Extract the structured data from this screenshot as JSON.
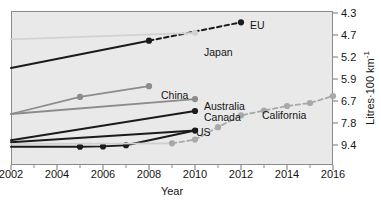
{
  "chart_data": {
    "type": "line",
    "title": "",
    "xlabel": "Year",
    "ylabel": "Litres·100 km⁻¹",
    "ylabel_base": "Litres·100 km",
    "ylabel_sup": "-1",
    "xlim": [
      2002,
      2016
    ],
    "ylim_display_top": 4.3,
    "ylim_display_bottom": 9.4,
    "y_axis_inverted": true,
    "y_axis_side": "right",
    "grid": false,
    "legend": "inline-end-labels",
    "xticks": [
      2002,
      2004,
      2006,
      2008,
      2010,
      2012,
      2014,
      2016
    ],
    "xtick_labels": [
      "2002",
      "2004",
      "2006",
      "2008",
      "2010",
      "2012",
      "2014",
      "2016"
    ],
    "xminor_ticks": [
      2003,
      2005,
      2007,
      2009,
      2011,
      2013,
      2015
    ],
    "yticks": [
      4.3,
      4.7,
      5.2,
      5.9,
      6.7,
      7.8,
      9.4
    ],
    "ytick_labels": [
      "4.3",
      "4.7",
      "5.2",
      "5.9",
      "6.7",
      "7.8",
      "9.4"
    ],
    "ytick_pixel_y": [
      13,
      35,
      57,
      79,
      101,
      123,
      145
    ],
    "series": [
      {
        "name": "EU",
        "label": "EU",
        "color": "#1b1b1b",
        "width": 2.0,
        "marker": "circle",
        "label_x": 250,
        "label_y": 26,
        "segments": [
          {
            "style": "solid",
            "points": [
              [
                2002,
                5.55
              ],
              [
                2008,
                4.83
              ]
            ]
          },
          {
            "style": "dashed",
            "points": [
              [
                2008,
                4.83
              ],
              [
                2012,
                4.47
              ]
            ]
          }
        ],
        "markers": [
          [
            2008,
            4.83
          ],
          [
            2012,
            4.47
          ]
        ]
      },
      {
        "name": "Japan",
        "label": "Japan",
        "color": "#d2d2d2",
        "width": 1.8,
        "marker": "circle",
        "label_x": 204,
        "label_y": 53,
        "segments": [
          {
            "style": "solid",
            "points": [
              [
                2002,
                4.8
              ],
              [
                2010,
                4.66
              ]
            ]
          }
        ],
        "markers": [
          [
            2010,
            4.66
          ]
        ]
      },
      {
        "name": "China",
        "label": "China",
        "color": "#8c8c8c",
        "width": 1.8,
        "marker": "circle",
        "label_x": 161,
        "label_y": 96,
        "segments": [
          {
            "style": "solid",
            "points": [
              [
                2002,
                7.35
              ],
              [
                2005,
                6.55
              ],
              [
                2008,
                6.16
              ]
            ]
          }
        ],
        "markers": [
          [
            2005,
            6.55
          ],
          [
            2008,
            6.16
          ]
        ]
      },
      {
        "name": "Australia",
        "label": "Australia",
        "color": "#8c8c8c",
        "width": 1.8,
        "marker": "circle",
        "label_x": 204,
        "label_y": 107,
        "segments": [
          {
            "style": "solid",
            "points": [
              [
                2002,
                7.35
              ],
              [
                2010,
                6.63
              ]
            ]
          }
        ],
        "markers": [
          [
            2010,
            6.63
          ]
        ]
      },
      {
        "name": "Canada",
        "label": "Canada",
        "color": "#1b1b1b",
        "width": 2.0,
        "marker": "circle",
        "label_x": 204,
        "label_y": 118,
        "segments": [
          {
            "style": "solid",
            "points": [
              [
                2002,
                9.05
              ],
              [
                2010,
                7.2
              ]
            ]
          }
        ],
        "markers": [
          [
            2010,
            7.2
          ]
        ]
      },
      {
        "name": "US",
        "label": "US",
        "color": "#1b1b1b",
        "width": 2.0,
        "marker": "circle",
        "label_x": 196,
        "label_y": 133,
        "segments": [
          {
            "style": "solid",
            "points": [
              [
                2002,
                9.2
              ],
              [
                2010,
                8.35
              ]
            ]
          }
        ],
        "markers": [
          [
            2010,
            8.35
          ]
        ]
      },
      {
        "name": "US-baseline",
        "label": "",
        "color": "#1b1b1b",
        "width": 2.0,
        "marker": "circle",
        "label_x": 0,
        "label_y": 0,
        "segments": [
          {
            "style": "solid",
            "points": [
              [
                2002,
                9.52
              ],
              [
                2005,
                9.52
              ],
              [
                2006,
                9.5
              ],
              [
                2007,
                9.42
              ],
              [
                2010,
                8.35
              ]
            ]
          }
        ],
        "markers": [
          [
            2005,
            9.52
          ],
          [
            2006,
            9.5
          ],
          [
            2007,
            9.42
          ]
        ]
      },
      {
        "name": "Japan-baseline",
        "label": "",
        "color": "#cfcfcf",
        "width": 1.6,
        "marker": "none",
        "label_x": 0,
        "label_y": 0,
        "segments": [
          {
            "style": "solid",
            "points": [
              [
                2002,
                9.33
              ],
              [
                2009,
                9.28
              ]
            ]
          }
        ],
        "markers": []
      },
      {
        "name": "California",
        "label": "California",
        "color": "#a8a8a8",
        "width": 1.8,
        "marker": "circle",
        "label_x": 262,
        "label_y": 116,
        "segments": [
          {
            "style": "dashed",
            "points": [
              [
                2009,
                9.28
              ],
              [
                2010,
                9.0
              ],
              [
                2011,
                8.1
              ],
              [
                2012,
                7.42
              ],
              [
                2013,
                7.18
              ],
              [
                2014,
                6.95
              ],
              [
                2015,
                6.8
              ],
              [
                2016,
                6.52
              ]
            ]
          }
        ],
        "markers": [
          [
            2009,
            9.28
          ],
          [
            2010,
            9.0
          ],
          [
            2011,
            8.1
          ],
          [
            2012,
            7.42
          ],
          [
            2013,
            7.18
          ],
          [
            2014,
            6.95
          ],
          [
            2015,
            6.8
          ],
          [
            2016,
            6.52
          ]
        ]
      }
    ]
  },
  "axes": {
    "plot_left": 11,
    "plot_top": 11,
    "plot_right": 333,
    "plot_bottom": 165,
    "frame_color": "#8b8b8b",
    "plot_bg": "#e9e9e9"
  }
}
